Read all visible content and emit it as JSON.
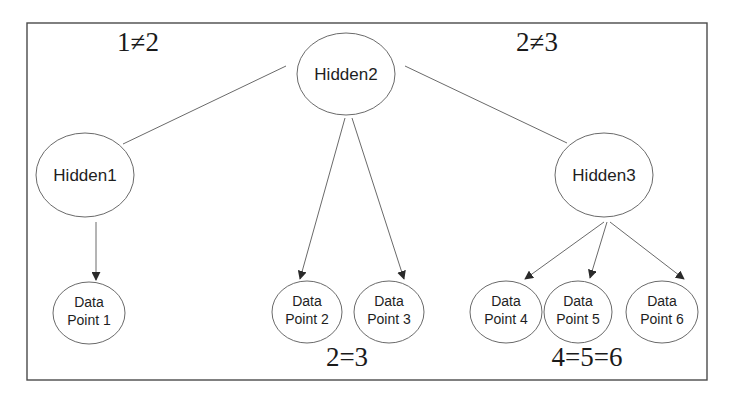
{
  "diagram": {
    "colors": {
      "background": "#ffffff",
      "stroke": "#6a6a6a",
      "text": "#1e1e1e"
    },
    "hidden_nodes": [
      {
        "id": "hidden1",
        "label": "Hidden1"
      },
      {
        "id": "hidden2",
        "label": "Hidden2"
      },
      {
        "id": "hidden3",
        "label": "Hidden3"
      }
    ],
    "data_nodes": [
      {
        "id": "dp1",
        "line1": "Data",
        "line2": "Point 1"
      },
      {
        "id": "dp2",
        "line1": "Data",
        "line2": "Point 2"
      },
      {
        "id": "dp3",
        "line1": "Data",
        "line2": "Point 3"
      },
      {
        "id": "dp4",
        "line1": "Data",
        "line2": "Point 4"
      },
      {
        "id": "dp5",
        "line1": "Data",
        "line2": "Point 5"
      },
      {
        "id": "dp6",
        "line1": "Data",
        "line2": "Point 6"
      }
    ],
    "edges": [
      {
        "from": "hidden2",
        "to": "hidden1",
        "type": "undirected"
      },
      {
        "from": "hidden2",
        "to": "hidden3",
        "type": "undirected"
      },
      {
        "from": "hidden1",
        "to": "dp1",
        "type": "directed"
      },
      {
        "from": "hidden2",
        "to": "dp2",
        "type": "directed"
      },
      {
        "from": "hidden2",
        "to": "dp3",
        "type": "directed"
      },
      {
        "from": "hidden3",
        "to": "dp4",
        "type": "directed"
      },
      {
        "from": "hidden3",
        "to": "dp5",
        "type": "directed"
      },
      {
        "from": "hidden3",
        "to": "dp6",
        "type": "directed"
      }
    ],
    "relations": {
      "h1_h2": "1≠2",
      "h2_h3": "2≠3",
      "dp2_dp3": "2=3",
      "dp4_dp5_dp6": "4=5=6"
    }
  }
}
